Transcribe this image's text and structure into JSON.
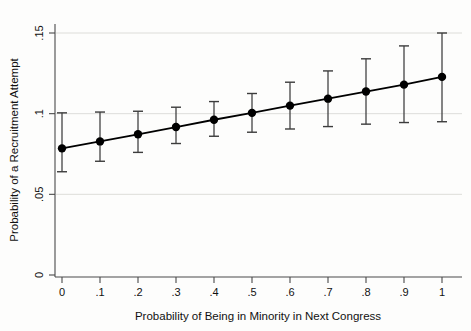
{
  "chart_data": {
    "type": "line",
    "title": "",
    "xlabel": "Probability of Being in Minority in Next Congress",
    "ylabel": "Probability of a Recruitment Attempt",
    "xlim": [
      0,
      1
    ],
    "ylim": [
      0,
      0.15
    ],
    "grid": true,
    "legend": null,
    "x_ticks": [
      0,
      0.1,
      0.2,
      0.3,
      0.4,
      0.5,
      0.6,
      0.7,
      0.8,
      0.9,
      1
    ],
    "x_tick_labels": [
      "0",
      ".1",
      ".2",
      ".3",
      ".4",
      ".5",
      ".6",
      ".7",
      ".8",
      ".9",
      "1"
    ],
    "y_ticks": [
      0,
      0.05,
      0.1,
      0.15
    ],
    "y_tick_labels": [
      "0",
      ".05",
      ".1",
      ".15"
    ],
    "error_type": "confidence-interval",
    "x": [
      0,
      0.1,
      0.2,
      0.3,
      0.4,
      0.5,
      0.6,
      0.7,
      0.8,
      0.9,
      1
    ],
    "values": [
      0.0785,
      0.0828,
      0.0872,
      0.0917,
      0.0962,
      0.1005,
      0.105,
      0.1093,
      0.1137,
      0.118,
      0.1228
    ],
    "err_low": [
      0.064,
      0.0705,
      0.076,
      0.0815,
      0.086,
      0.0885,
      0.0905,
      0.092,
      0.0935,
      0.0945,
      0.095
    ],
    "err_high": [
      0.1005,
      0.101,
      0.1015,
      0.104,
      0.1075,
      0.1125,
      0.1195,
      0.1265,
      0.134,
      0.142,
      0.15
    ],
    "series": [
      {
        "name": "Predicted probability",
        "values": [
          0.0785,
          0.0828,
          0.0872,
          0.0917,
          0.0962,
          0.1005,
          0.105,
          0.1093,
          0.1137,
          0.118,
          0.1228
        ]
      }
    ]
  },
  "colors": {
    "line": "#000000",
    "marker": "#000000",
    "error_bar": "#3c3c3c",
    "gridline": "#d9d9d6",
    "axis": "#4a4a4a",
    "background": "#fdfdfc"
  }
}
